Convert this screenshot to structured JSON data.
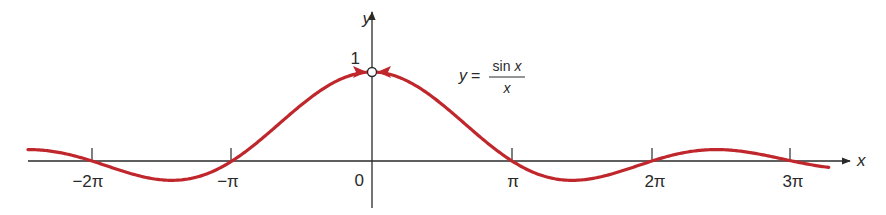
{
  "chart_data": {
    "type": "line",
    "title": "",
    "function": "y = sin x / x",
    "xlabel": "x",
    "ylabel": "y",
    "x_ticks": [
      {
        "label": "−2π",
        "value": -6.2832
      },
      {
        "label": "−π",
        "value": -3.1416
      },
      {
        "label": "0",
        "value": 0
      },
      {
        "label": "π",
        "value": 3.1416
      },
      {
        "label": "2π",
        "value": 6.2832
      },
      {
        "label": "3π",
        "value": 9.4248
      }
    ],
    "y_ticks": [
      {
        "label": "1",
        "value": 1
      }
    ],
    "xlim": [
      -7.72,
      10.25
    ],
    "ylim": [
      -0.55,
      1.15
    ],
    "grid": false,
    "legend": null,
    "annotations": [
      {
        "text_lhs": "y =",
        "numerator": "sin x",
        "denominator": "x",
        "position": "right of peak"
      },
      {
        "type": "open-circle",
        "x": 0,
        "y": 1,
        "note": "hole: function undefined at x = 0"
      },
      {
        "type": "arrows",
        "note": "two arrows approaching (0,1) from both sides"
      }
    ],
    "series": [
      {
        "name": "sin x / x",
        "color": "#c0272d",
        "x": [
          -7.72,
          -6.2832,
          -4.4934,
          -3.1416,
          -1.5708,
          -0.3,
          0.3,
          1.5708,
          3.1416,
          4.4934,
          6.2832,
          7.7253,
          9.4248,
          10.25
        ],
        "values": [
          0.128,
          0,
          -0.217,
          0,
          0.637,
          0.985,
          0.985,
          0.637,
          0,
          -0.217,
          0,
          0.128,
          0,
          -0.071
        ]
      }
    ]
  },
  "labels": {
    "y_axis": "y",
    "x_axis": "x",
    "y_one": "1",
    "origin": "0",
    "eq_lhs": "y =",
    "eq_num": "sin x",
    "eq_den": "x",
    "ticks": [
      "−2π",
      "−π",
      "π",
      "2π",
      "3π"
    ]
  },
  "colors": {
    "curve": "#c0272d",
    "axis": "#2a2a2a",
    "background": "#ffffff"
  }
}
